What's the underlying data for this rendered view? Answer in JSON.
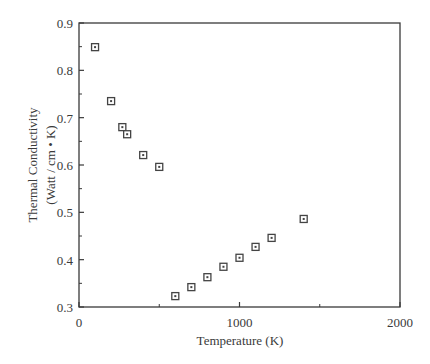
{
  "chart_data": {
    "type": "scatter",
    "title": "",
    "xlabel": "Temperature (K)",
    "ylabel_line1": "Thermal Conductivity",
    "ylabel_line2": "(Watt / cm • K)",
    "xlim": [
      0,
      2000
    ],
    "ylim": [
      0.3,
      0.9
    ],
    "x_ticks": [
      0,
      1000,
      2000
    ],
    "x_tick_labels": [
      "0",
      "1000",
      "2000"
    ],
    "x_minor_ticks": [
      500,
      1500
    ],
    "y_ticks": [
      0.3,
      0.4,
      0.5,
      0.6,
      0.7,
      0.8,
      0.9
    ],
    "y_tick_labels": [
      "0.3",
      "0.4",
      "0.5",
      "0.6",
      "0.7",
      "0.8",
      "0.9"
    ],
    "y_minor_ticks": [
      0.35,
      0.45,
      0.55,
      0.65,
      0.75,
      0.85
    ],
    "grid": false,
    "legend": null,
    "marker": "square-with-dot",
    "series": [
      {
        "name": "Thermal Conductivity",
        "x": [
          100,
          200,
          270,
          300,
          400,
          500,
          600,
          700,
          800,
          900,
          1000,
          1100,
          1200,
          1400
        ],
        "y": [
          0.849,
          0.735,
          0.68,
          0.665,
          0.621,
          0.596,
          0.323,
          0.342,
          0.363,
          0.385,
          0.404,
          0.427,
          0.446,
          0.486
        ]
      }
    ]
  },
  "colors": {
    "axis": "#3a3a3a",
    "marker": "#444444",
    "background": "#ffffff"
  }
}
